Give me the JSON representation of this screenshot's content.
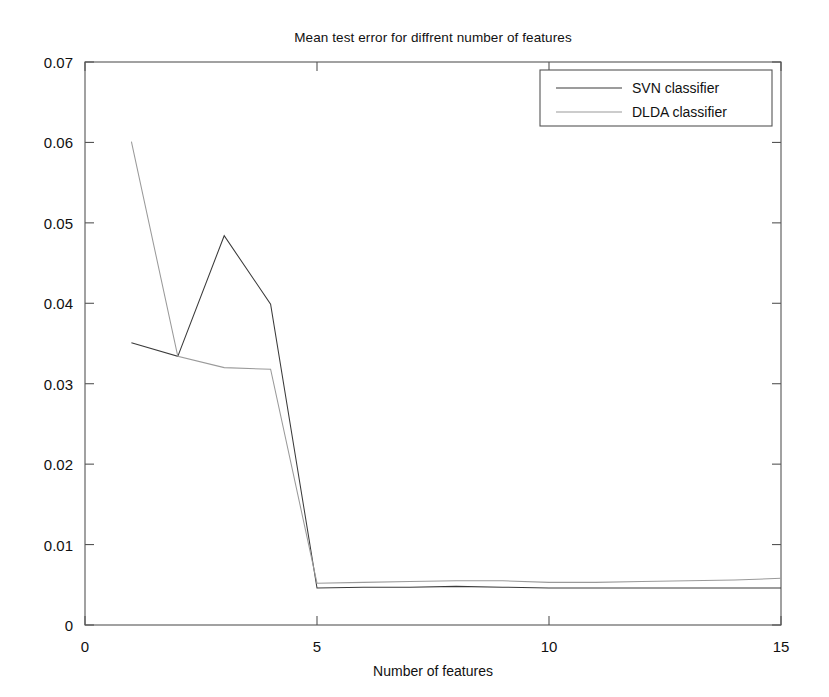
{
  "chart_data": {
    "type": "line",
    "title": "Mean test error for diffrent number of features",
    "xlabel": "Number of features",
    "ylabel": "",
    "xlim": [
      0,
      15
    ],
    "ylim": [
      0,
      0.07
    ],
    "xticks": [
      "0",
      "5",
      "10",
      "15"
    ],
    "xtick_values": [
      0,
      5,
      10,
      15
    ],
    "yticks": [
      "0",
      "0.01",
      "0.02",
      "0.03",
      "0.04",
      "0.05",
      "0.06",
      "0.07"
    ],
    "ytick_values": [
      0,
      0.01,
      0.02,
      0.03,
      0.04,
      0.05,
      0.06,
      0.07
    ],
    "grid": false,
    "legend_position": "top-right",
    "x": [
      1,
      2,
      3,
      4,
      5,
      6,
      7,
      8,
      9,
      10,
      11,
      12,
      13,
      14,
      15
    ],
    "series": [
      {
        "name": "SVN classifier",
        "color": "#3a3a3a",
        "values": [
          0.0351,
          0.0334,
          0.0484,
          0.0399,
          0.0046,
          0.0047,
          0.0047,
          0.0048,
          0.0047,
          0.0046,
          0.0046,
          0.0046,
          0.0046,
          0.0046,
          0.0046
        ]
      },
      {
        "name": "DLDA classifier",
        "color": "#9a9a9a",
        "values": [
          0.0601,
          0.0334,
          0.032,
          0.0318,
          0.0052,
          0.0053,
          0.0054,
          0.0055,
          0.0055,
          0.0053,
          0.0053,
          0.0054,
          0.0055,
          0.0056,
          0.0058
        ]
      }
    ]
  },
  "legend": {
    "entries": [
      {
        "label": "SVN classifier"
      },
      {
        "label": "DLDA classifier"
      }
    ]
  },
  "axes": {
    "x_label": "Number of features",
    "x_tick_labels": [
      "0",
      "5",
      "10",
      "15"
    ],
    "y_tick_labels": [
      "0.07",
      "0.06",
      "0.05",
      "0.04",
      "0.03",
      "0.02",
      "0.01",
      "0"
    ]
  },
  "header": {
    "title": "Mean test error for diffrent number of features"
  },
  "colors": {
    "series_1": "#3a3a3a",
    "series_2": "#9a9a9a",
    "axis": "#555555",
    "background": "#ffffff"
  }
}
